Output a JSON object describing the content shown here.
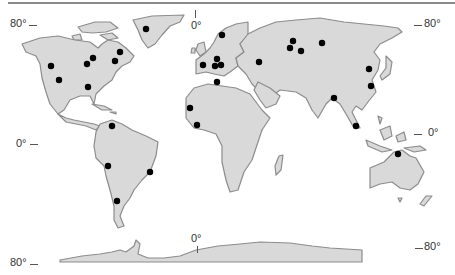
{
  "map": {
    "type": "world-outline",
    "land_color": "#d9d9d9",
    "coast_color": "#8c8c8c",
    "marker_color": "#000000",
    "labels": {
      "left_top": "80°",
      "left_mid": "0°",
      "left_bottom": "80°",
      "right_top": "80°",
      "right_mid": "0°",
      "right_bottom": "80°",
      "meridian_top": "0°",
      "meridian_bottom": "0°"
    },
    "markers": [
      {
        "region": "greenland",
        "x": 146,
        "y": 29
      },
      {
        "region": "north-america",
        "x": 51,
        "y": 66
      },
      {
        "region": "north-america",
        "x": 59,
        "y": 80
      },
      {
        "region": "north-america",
        "x": 87,
        "y": 64
      },
      {
        "region": "north-america",
        "x": 93,
        "y": 58
      },
      {
        "region": "north-america",
        "x": 120,
        "y": 52
      },
      {
        "region": "north-america",
        "x": 115,
        "y": 61
      },
      {
        "region": "north-america",
        "x": 88,
        "y": 87
      },
      {
        "region": "europe",
        "x": 222,
        "y": 35
      },
      {
        "region": "europe",
        "x": 203,
        "y": 65
      },
      {
        "region": "europe",
        "x": 217,
        "y": 59
      },
      {
        "region": "europe",
        "x": 215,
        "y": 66
      },
      {
        "region": "europe",
        "x": 221,
        "y": 65
      },
      {
        "region": "africa",
        "x": 217,
        "y": 82
      },
      {
        "region": "asia",
        "x": 259,
        "y": 62
      },
      {
        "region": "africa",
        "x": 190,
        "y": 108
      },
      {
        "region": "africa",
        "x": 197,
        "y": 125
      },
      {
        "region": "asia",
        "x": 293,
        "y": 41
      },
      {
        "region": "asia",
        "x": 290,
        "y": 48
      },
      {
        "region": "asia",
        "x": 301,
        "y": 51
      },
      {
        "region": "asia",
        "x": 322,
        "y": 43
      },
      {
        "region": "asia",
        "x": 369,
        "y": 69
      },
      {
        "region": "asia",
        "x": 371,
        "y": 86
      },
      {
        "region": "asia",
        "x": 334,
        "y": 98
      },
      {
        "region": "asia",
        "x": 356,
        "y": 126
      },
      {
        "region": "australia",
        "x": 398,
        "y": 154
      },
      {
        "region": "south-america",
        "x": 112,
        "y": 126
      },
      {
        "region": "south-america",
        "x": 108,
        "y": 166
      },
      {
        "region": "south-america",
        "x": 150,
        "y": 172
      },
      {
        "region": "south-america",
        "x": 117,
        "y": 201
      }
    ]
  }
}
